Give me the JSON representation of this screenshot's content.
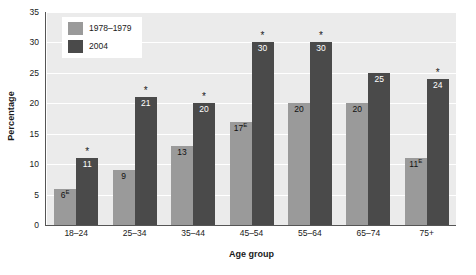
{
  "chart_data": {
    "type": "bar",
    "title": "",
    "xlabel": "Age group",
    "ylabel": "Percentage",
    "ylim": [
      0,
      35
    ],
    "yticks": [
      0,
      5,
      10,
      15,
      20,
      25,
      30,
      35
    ],
    "grid": true,
    "legend_position": "top-left",
    "categories": [
      "18–24",
      "25–34",
      "35–44",
      "45–54",
      "55–64",
      "65–74",
      "75+"
    ],
    "series": [
      {
        "name": "1978–1979",
        "color": "#9a9a9a",
        "values": [
          6,
          9,
          13,
          17,
          20,
          20,
          11
        ],
        "labels": [
          "6",
          "9",
          "13",
          "17",
          "20",
          "20",
          "11"
        ],
        "quality_flags": [
          "E",
          "",
          "",
          "E",
          "",
          "",
          "E"
        ],
        "significance": [
          "",
          "",
          "",
          "",
          "",
          "",
          ""
        ]
      },
      {
        "name": "2004",
        "color": "#4a4a4a",
        "values": [
          11,
          21,
          20,
          30,
          30,
          25,
          24
        ],
        "labels": [
          "11",
          "21",
          "20",
          "30",
          "30",
          "25",
          "24"
        ],
        "quality_flags": [
          "",
          "",
          "",
          "",
          "",
          "",
          ""
        ],
        "significance": [
          "*",
          "*",
          "*",
          "*",
          "*",
          "",
          "*"
        ]
      }
    ]
  },
  "legend": {
    "items": [
      {
        "label": "1978–1979",
        "color": "#9a9a9a"
      },
      {
        "label": "2004",
        "color": "#4a4a4a"
      }
    ]
  },
  "axes": {
    "y_title": "Percentage",
    "x_title": "Age group",
    "y_tick_labels": [
      "0",
      "5",
      "10",
      "15",
      "20",
      "25",
      "30",
      "35"
    ],
    "x_tick_labels": [
      "18–24",
      "25–34",
      "35–44",
      "45–54",
      "55–64",
      "65–74",
      "75+"
    ]
  },
  "style": {
    "plot_background": "#ebebeb",
    "gridline_color": "#ffffff",
    "axis_color": "#555555",
    "page_background": "#ffffff"
  }
}
